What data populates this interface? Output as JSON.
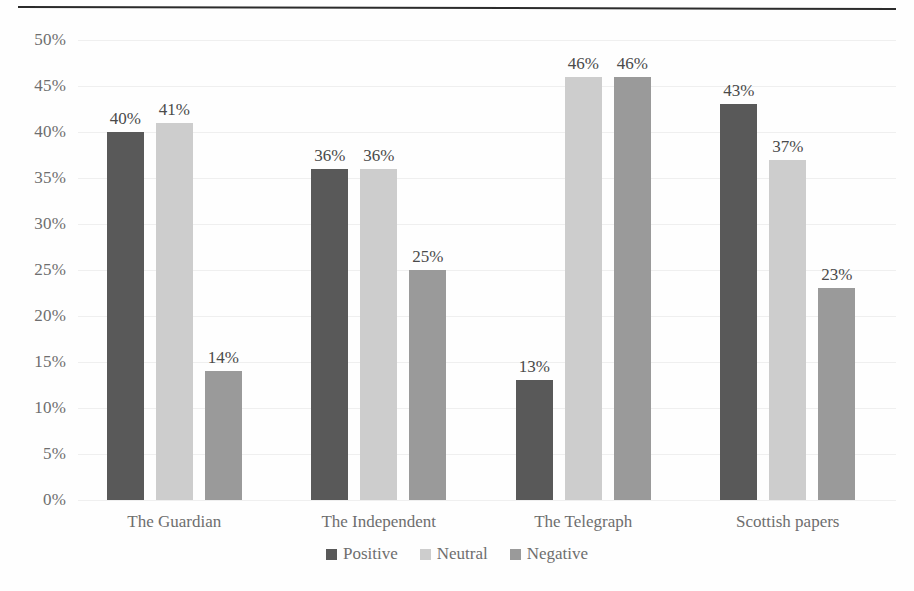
{
  "chart_data": {
    "type": "bar",
    "title": "",
    "subtitle": "",
    "xlabel": "",
    "ylabel": "",
    "ylim": [
      0,
      50
    ],
    "ytick_step": 5,
    "ytick_labels": [
      "50%",
      "45%",
      "40%",
      "35%",
      "30%",
      "25%",
      "20%",
      "15%",
      "10%",
      "5%",
      "0%"
    ],
    "ytick_values": [
      50,
      45,
      40,
      35,
      30,
      25,
      20,
      15,
      10,
      5,
      0
    ],
    "grid": true,
    "grid_axis": "y",
    "legend_position": "bottom-center",
    "value_format": "{v}%",
    "categories": [
      "The Guardian",
      "The Independent",
      "The Telegraph",
      "Scottish papers"
    ],
    "series": [
      {
        "name": "Positive",
        "color": "#595959",
        "values": [
          40,
          36,
          13,
          43
        ],
        "labels": [
          "40%",
          "36%",
          "13%",
          "43%"
        ]
      },
      {
        "name": "Neutral",
        "color": "#cdcdcd",
        "values": [
          41,
          36,
          46,
          37
        ],
        "labels": [
          "41%",
          "36%",
          "46%",
          "37%"
        ]
      },
      {
        "name": "Negative",
        "color": "#9a9a9a",
        "values": [
          14,
          25,
          46,
          23
        ],
        "labels": [
          "14%",
          "25%",
          "46%",
          "23%"
        ]
      }
    ]
  },
  "legend": {
    "items": [
      {
        "label": "Positive",
        "color": "#595959"
      },
      {
        "label": "Neutral",
        "color": "#cdcdcd"
      },
      {
        "label": "Negative",
        "color": "#9a9a9a"
      }
    ]
  },
  "colors": {
    "background": "#fefefe",
    "top_rule": "#2b2b2b",
    "gridline": "#efefef",
    "axis_text": "#6e6e6e",
    "label_text": "#4a4a4a",
    "series_positive": "#595959",
    "series_neutral": "#cdcdcd",
    "series_negative": "#9a9a9a"
  }
}
